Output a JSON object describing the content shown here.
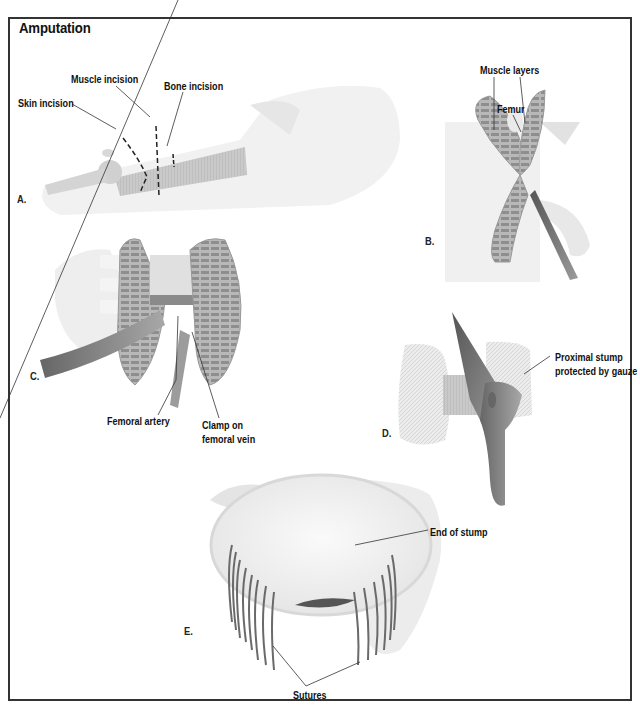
{
  "figure": {
    "title": "Amputation",
    "border_color": "#333333",
    "panels": [
      {
        "letter": "A.",
        "labels": [
          "Skin incision",
          "Muscle incision",
          "Bone incision"
        ]
      },
      {
        "letter": "B.",
        "labels": [
          "Muscle layers",
          "Femur"
        ]
      },
      {
        "letter": "C.",
        "labels": [
          "Femoral artery",
          "Clamp on",
          "femoral vein"
        ]
      },
      {
        "letter": "D.",
        "labels": [
          "Proximal stump",
          "protected by gauze"
        ]
      },
      {
        "letter": "E.",
        "labels": [
          "End of stump",
          "Sutures"
        ]
      }
    ]
  }
}
